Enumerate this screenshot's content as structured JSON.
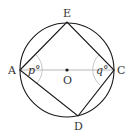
{
  "figure": {
    "type": "geometry",
    "colors": {
      "stroke": "#1a1a1a",
      "diameter": "#b0b0b0",
      "arc": "#b8b8b8",
      "text": "#333333"
    },
    "circle": {
      "center": "O",
      "cx": 67,
      "cy": 70,
      "r": 47
    },
    "points": {
      "A": {
        "label": "A",
        "x": 20,
        "y": 70
      },
      "E": {
        "label": "E",
        "x": 67,
        "y": 22
      },
      "C": {
        "label": "C",
        "x": 114,
        "y": 70
      },
      "D": {
        "label": "D",
        "x": 78,
        "y": 116
      },
      "O": {
        "label": "O",
        "x": 67,
        "y": 70
      }
    },
    "angles": {
      "A": {
        "label": "p°",
        "vertex": "A"
      },
      "C": {
        "label": "q°",
        "vertex": "C"
      }
    }
  }
}
